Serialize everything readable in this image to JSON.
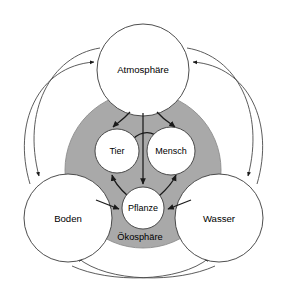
{
  "diagram": {
    "title": "Ökosphäre",
    "language": "de",
    "type": "nested-circles-flow",
    "background_color": "#ffffff",
    "sphere": {
      "label": "Ökosphäre",
      "fill_color": "#a9a9a9",
      "stroke_color": "#8c8c8c",
      "cx": 143,
      "cy": 170,
      "r": 78,
      "label_x": 140,
      "label_y": 238
    },
    "outer_nodes": [
      {
        "id": "atmosphaere",
        "label": "Atmosphäre",
        "cx": 143,
        "cy": 70,
        "r": 46,
        "fill_color": "#ffffff",
        "stroke_color": "#3a3a3a"
      },
      {
        "id": "boden",
        "label": "Boden",
        "cx": 68,
        "cy": 218,
        "r": 44,
        "fill_color": "#ffffff",
        "stroke_color": "#3a3a3a"
      },
      {
        "id": "wasser",
        "label": "Wasser",
        "cx": 219,
        "cy": 218,
        "r": 44,
        "fill_color": "#ffffff",
        "stroke_color": "#3a3a3a"
      }
    ],
    "inner_nodes": [
      {
        "id": "tier",
        "label": "Tier",
        "cx": 117,
        "cy": 151,
        "r": 22,
        "fill_color": "#ffffff",
        "stroke_color": "#3a3a3a"
      },
      {
        "id": "mensch",
        "label": "Mensch",
        "cx": 171,
        "cy": 151,
        "r": 24,
        "fill_color": "#ffffff",
        "stroke_color": "#3a3a3a"
      },
      {
        "id": "pflanze",
        "label": "Pflanze",
        "cx": 143,
        "cy": 208,
        "r": 21,
        "fill_color": "#ffffff",
        "stroke_color": "#3a3a3a"
      }
    ],
    "flow_arrows": [
      {
        "id": "atmosphaere-to-tier",
        "from": "atmosphaere",
        "to": "tier",
        "style": "curved"
      },
      {
        "id": "atmosphaere-to-mensch",
        "from": "atmosphaere",
        "to": "mensch",
        "style": "curved"
      },
      {
        "id": "atmosphaere-to-pflanze",
        "from": "atmosphaere",
        "to": "pflanze",
        "style": "straight"
      },
      {
        "id": "tier-to-mensch",
        "from": "tier",
        "to": "mensch",
        "style": "arc"
      },
      {
        "id": "pflanze-to-tier",
        "from": "pflanze",
        "to": "tier",
        "style": "arc"
      },
      {
        "id": "pflanze-to-mensch",
        "from": "pflanze",
        "to": "mensch",
        "style": "arc"
      },
      {
        "id": "boden-to-pflanze",
        "from": "boden",
        "to": "pflanze",
        "style": "straight"
      },
      {
        "id": "wasser-to-pflanze",
        "from": "wasser",
        "to": "pflanze",
        "style": "straight"
      }
    ],
    "outer_arcs": [
      {
        "id": "boden-to-atmosphaere",
        "from": "boden",
        "to": "atmosphaere"
      },
      {
        "id": "atmosphaere-to-boden",
        "from": "atmosphaere",
        "to": "boden"
      },
      {
        "id": "wasser-to-atmosphaere",
        "from": "wasser",
        "to": "atmosphaere"
      },
      {
        "id": "atmosphaere-to-wasser",
        "from": "atmosphaere",
        "to": "wasser"
      },
      {
        "id": "boden-to-wasser",
        "from": "boden",
        "to": "wasser"
      },
      {
        "id": "wasser-to-boden",
        "from": "wasser",
        "to": "boden"
      }
    ]
  }
}
